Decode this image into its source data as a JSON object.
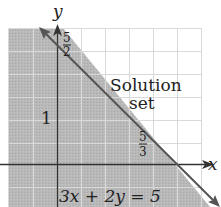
{
  "figure": {
    "axes": {
      "x_label": "x",
      "y_label": "y"
    },
    "labels": {
      "region_line1": "Solution",
      "region_line2": "set",
      "y_intercept_num": "5",
      "y_intercept_den": "2",
      "x_intercept_num": "5",
      "x_intercept_den": "3",
      "y_tick_one": "1",
      "equation": "3x + 2y = 5"
    },
    "colors": {
      "shade": "#b5b5b5",
      "grid": "#d8d8d8",
      "axis": "#333333",
      "line": "#555555"
    }
  }
}
